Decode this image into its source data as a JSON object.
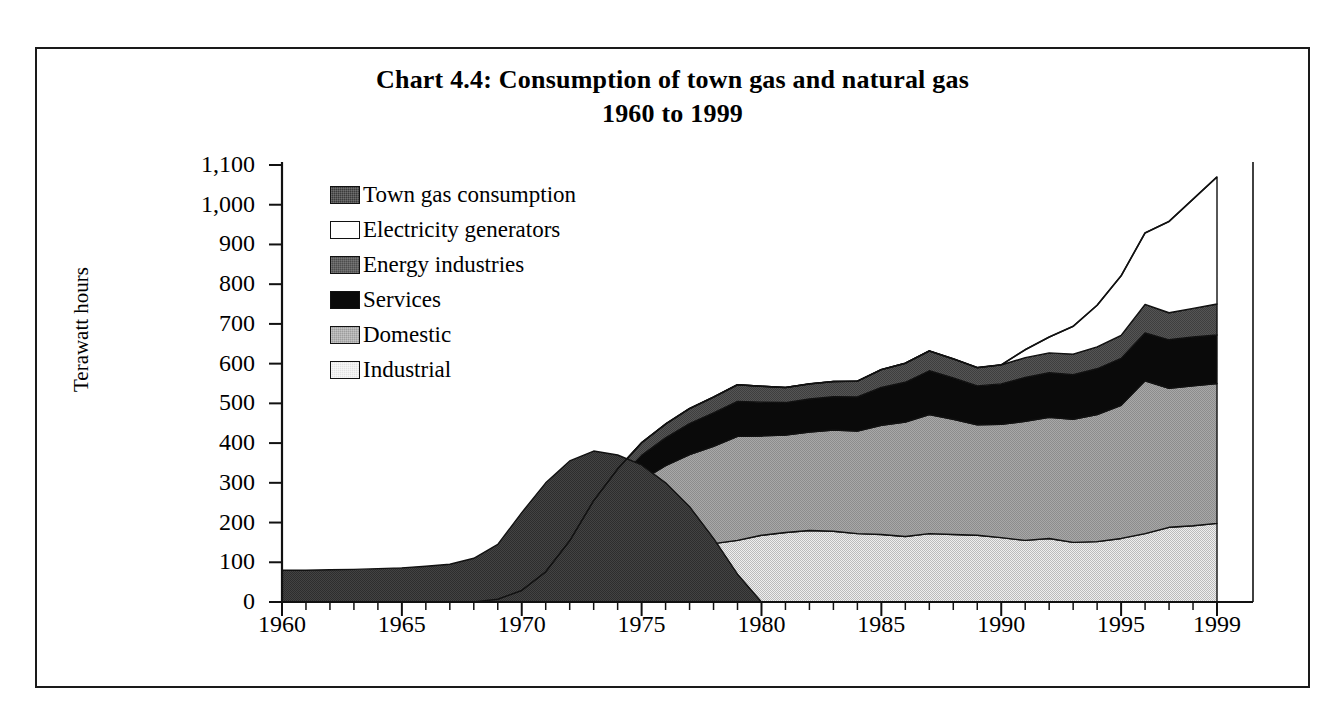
{
  "title": {
    "line1": "Chart 4.4:  Consumption of town gas and natural gas",
    "line2": "1960 to 1999"
  },
  "axes": {
    "y_title": "Terawatt hours",
    "y_ticks": [
      "0",
      "100",
      "200",
      "300",
      "400",
      "500",
      "600",
      "700",
      "800",
      "900",
      "1,000",
      "1,100"
    ],
    "x_ticks": [
      "1960",
      "1965",
      "1970",
      "1975",
      "1980",
      "1985",
      "1990",
      "1995",
      "1999"
    ]
  },
  "legend": {
    "items": [
      {
        "label": "Town gas consumption",
        "color": "#3b3b3b",
        "swatch": "swatch-town-gas"
      },
      {
        "label": "Electricity generators",
        "color": "#ffffff",
        "swatch": "swatch-electricity-generators"
      },
      {
        "label": "Energy industries",
        "color": "#4d4d4d",
        "swatch": "swatch-energy-industries"
      },
      {
        "label": "Services",
        "color": "#0a0a0a",
        "swatch": "swatch-services"
      },
      {
        "label": "Domestic",
        "color": "#9d9d9d",
        "swatch": "swatch-domestic"
      },
      {
        "label": "Industrial",
        "color": "#e2e2e2",
        "swatch": "swatch-industrial"
      }
    ]
  },
  "chart_data": {
    "type": "area",
    "title": "Chart 4.4:  Consumption of town gas and natural gas 1960 to 1999",
    "xlabel": "",
    "ylabel": "Terawatt hours",
    "ylim": [
      0,
      1100
    ],
    "xlim": [
      1960,
      1999
    ],
    "grid": false,
    "legend_position": "inside-top-left",
    "stacked": true,
    "note": "Natural gas series are stacked bottom-up: Industrial, Domestic, Services, Energy industries, Electricity generators. Town gas consumption is drawn as a separate overlay area from 1960 and fades out by about 1977.",
    "x": [
      1960,
      1961,
      1962,
      1963,
      1964,
      1965,
      1966,
      1967,
      1968,
      1969,
      1970,
      1971,
      1972,
      1973,
      1974,
      1975,
      1976,
      1977,
      1978,
      1979,
      1980,
      1981,
      1982,
      1983,
      1984,
      1985,
      1986,
      1987,
      1988,
      1989,
      1990,
      1991,
      1992,
      1993,
      1994,
      1995,
      1996,
      1997,
      1998,
      1999
    ],
    "series": [
      {
        "name": "Industrial",
        "values": [
          0,
          0,
          0,
          0,
          0,
          0,
          0,
          0,
          0,
          2,
          8,
          22,
          45,
          75,
          100,
          122,
          135,
          143,
          147,
          155,
          168,
          175,
          180,
          178,
          172,
          170,
          165,
          172,
          170,
          168,
          162,
          155,
          160,
          150,
          152,
          160,
          172,
          188,
          192,
          198
        ]
      },
      {
        "name": "Domestic",
        "values": [
          0,
          0,
          0,
          0,
          0,
          0,
          0,
          0,
          0,
          3,
          14,
          38,
          75,
          120,
          155,
          185,
          208,
          228,
          245,
          262,
          250,
          245,
          248,
          255,
          258,
          275,
          288,
          300,
          290,
          278,
          285,
          300,
          305,
          310,
          320,
          335,
          385,
          350,
          352,
          352
        ]
      },
      {
        "name": "Services",
        "values": [
          0,
          0,
          0,
          0,
          0,
          0,
          0,
          0,
          0,
          1,
          4,
          10,
          22,
          40,
          52,
          62,
          70,
          78,
          84,
          88,
          85,
          82,
          83,
          84,
          86,
          95,
          100,
          110,
          104,
          98,
          102,
          110,
          112,
          112,
          115,
          118,
          120,
          122,
          123,
          122
        ]
      },
      {
        "name": "Energy industries",
        "values": [
          0,
          0,
          0,
          0,
          0,
          0,
          0,
          0,
          0,
          1,
          3,
          6,
          12,
          20,
          28,
          32,
          35,
          38,
          40,
          42,
          40,
          38,
          38,
          38,
          40,
          45,
          48,
          50,
          48,
          46,
          48,
          50,
          50,
          52,
          55,
          58,
          72,
          68,
          72,
          78
        ]
      },
      {
        "name": "Electricity generators",
        "values": [
          0,
          0,
          0,
          0,
          0,
          0,
          0,
          0,
          0,
          0,
          0,
          0,
          0,
          0,
          0,
          0,
          0,
          0,
          0,
          0,
          0,
          0,
          0,
          0,
          0,
          0,
          0,
          0,
          0,
          0,
          0,
          20,
          40,
          70,
          105,
          150,
          180,
          230,
          275,
          320
        ]
      }
    ],
    "town_gas": {
      "name": "Town gas consumption",
      "values": [
        80,
        80,
        81,
        82,
        84,
        86,
        90,
        95,
        110,
        145,
        225,
        300,
        355,
        380,
        370,
        345,
        300,
        240,
        160,
        70,
        0,
        0,
        0,
        0,
        0,
        0,
        0,
        0,
        0,
        0,
        0,
        0,
        0,
        0,
        0,
        0,
        0,
        0,
        0,
        0
      ]
    },
    "totals_natural_gas": [
      0,
      0,
      0,
      0,
      0,
      0,
      0,
      0,
      0,
      7,
      29,
      76,
      154,
      255,
      335,
      401,
      448,
      487,
      516,
      547,
      543,
      540,
      549,
      555,
      556,
      585,
      601,
      632,
      612,
      590,
      597,
      635,
      667,
      694,
      747,
      821,
      929,
      958,
      1014,
      1070
    ]
  }
}
